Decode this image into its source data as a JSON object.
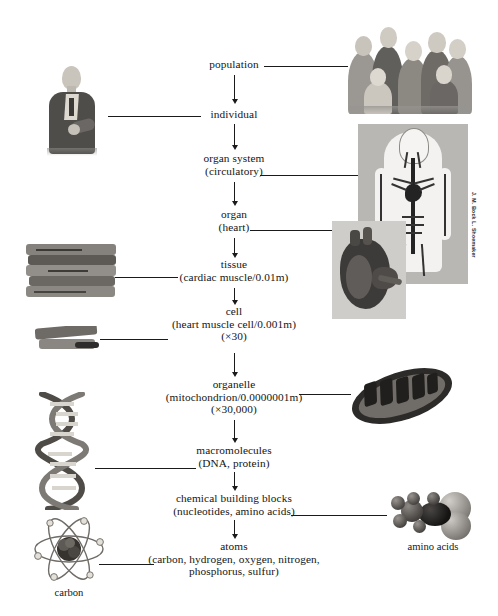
{
  "figure": {
    "type": "hierarchy-diagram",
    "credit": "J. M. Bock  L. Shoemaker"
  },
  "chain": [
    {
      "id": "population",
      "line1": "population",
      "line2": "",
      "line3": "",
      "link_side": "right",
      "image": "group-of-people"
    },
    {
      "id": "individual",
      "line1": "individual",
      "line2": "",
      "line3": "",
      "link_side": "left",
      "image": "single-person"
    },
    {
      "id": "organ-system",
      "line1": "organ system",
      "line2": "(circulatory)",
      "line3": "",
      "link_side": "right",
      "image": "circulatory-system"
    },
    {
      "id": "organ",
      "line1": "organ",
      "line2": "(heart)",
      "line3": "",
      "link_side": "right",
      "image": "heart"
    },
    {
      "id": "tissue",
      "line1": "tissue",
      "line2": "(cardiac muscle/0.01m)",
      "line3": "",
      "link_side": "left",
      "image": "cardiac-muscle-tissue"
    },
    {
      "id": "cell",
      "line1": "cell",
      "line2": "(heart muscle cell/0.001m)",
      "line3": "(×30)",
      "link_side": "left",
      "image": "heart-muscle-cell"
    },
    {
      "id": "organelle",
      "line1": "organelle",
      "line2": "(mitochondrion/0.0000001m)",
      "line3": "(×30,000)",
      "link_side": "right",
      "image": "mitochondrion"
    },
    {
      "id": "macromolecules",
      "line1": "macromolecules",
      "line2": "(DNA, protein)",
      "line3": "",
      "link_side": "left",
      "image": "dna-double-helix"
    },
    {
      "id": "chemical-building-blocks",
      "line1": "chemical building blocks",
      "line2": "(nucleotides, amino acids)",
      "line3": "",
      "link_side": "right",
      "image": "amino-acid-molecule"
    },
    {
      "id": "atoms",
      "line1": "atoms",
      "line2": "(carbon, hydrogen, oxygen, nitrogen,",
      "line3": "phosphorus, sulfur)",
      "link_side": "left",
      "image": "carbon-atom"
    }
  ],
  "captions": {
    "amino_acids": "amino acids",
    "carbon": "carbon"
  },
  "colors": {
    "ink": "#1a1a1a",
    "paper": "#ffffff",
    "plate_gray": "#b9b7b4",
    "heart_gray": "#cfcdc9"
  }
}
